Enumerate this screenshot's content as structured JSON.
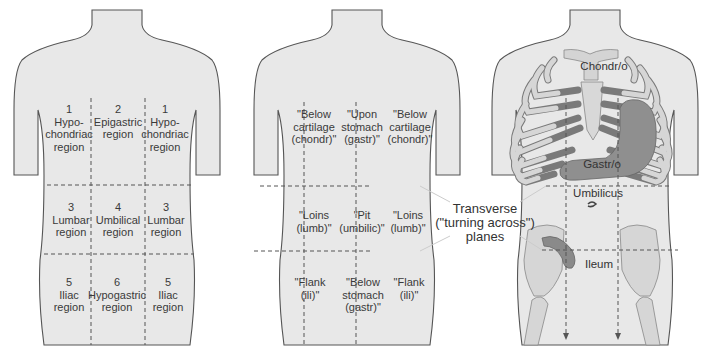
{
  "figure_1": {
    "title": "Abdominal regions (numbered)",
    "regions": [
      {
        "num": "1",
        "line1": "Hypo-",
        "line2": "chondriac",
        "line3": "region"
      },
      {
        "num": "2",
        "line1": "Epigastric",
        "line2": "region",
        "line3": ""
      },
      {
        "num": "1",
        "line1": "Hypo-",
        "line2": "chondriac",
        "line3": "region"
      },
      {
        "num": "3",
        "line1": "Lumbar",
        "line2": "region",
        "line3": ""
      },
      {
        "num": "4",
        "line1": "Umbilical",
        "line2": "region",
        "line3": ""
      },
      {
        "num": "3",
        "line1": "Lumbar",
        "line2": "region",
        "line3": ""
      },
      {
        "num": "5",
        "line1": "Iliac",
        "line2": "region",
        "line3": ""
      },
      {
        "num": "6",
        "line1": "Hypogastric",
        "line2": "region",
        "line3": ""
      },
      {
        "num": "5",
        "line1": "Iliac",
        "line2": "region",
        "line3": ""
      }
    ]
  },
  "figure_2": {
    "title": "Region name meanings",
    "regions": [
      {
        "line1": "\"Below",
        "line2": "cartilage",
        "line3": "(chondr)\""
      },
      {
        "line1": "\"Upon",
        "line2": "stomach",
        "line3": "(gastr)\""
      },
      {
        "line1": "\"Below",
        "line2": "cartilage",
        "line3": "(chondr)\""
      },
      {
        "line1": "\"Loins",
        "line2": "(lumb)\"",
        "line3": ""
      },
      {
        "line1": "\"Pit",
        "line2": "(umbilic)\"",
        "line3": ""
      },
      {
        "line1": "\"Loins",
        "line2": "(lumb)\"",
        "line3": ""
      },
      {
        "line1": "\"Flank",
        "line2": "(ili)\"",
        "line3": ""
      },
      {
        "line1": "\"Below",
        "line2": "stomach",
        "line3": "(gastr)\""
      },
      {
        "line1": "\"Flank",
        "line2": "(ili)\"",
        "line3": ""
      }
    ],
    "plane_label": {
      "line1": "Transverse",
      "line2": "(\"turning across\")",
      "line3": "planes"
    }
  },
  "figure_3": {
    "title": "Anatomical structures",
    "labels": {
      "chondro": "Chondr/o",
      "gastro": "Gastr/o",
      "umbilicus": "Umbilicus",
      "ileum": "Ileum"
    }
  },
  "colors": {
    "skin": "#e8e8e8",
    "outline": "#555555",
    "bone": "#d2d2d2",
    "cartilage": "#a9a9a9",
    "organ": "#9a9a9a",
    "dash": "#555555",
    "leader": "#cccccc"
  }
}
